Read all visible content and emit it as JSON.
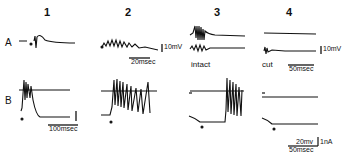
{
  "figure": {
    "columns": [
      "1",
      "2",
      "3",
      "4"
    ],
    "rows": [
      "A",
      "B"
    ],
    "row_a": {
      "scale_2": {
        "voltage": "10mV",
        "time": "20msec"
      },
      "scale_4": {
        "voltage": "10mV",
        "time": "50msec"
      },
      "label_3": "intact",
      "label_4": "cut"
    },
    "row_b": {
      "scale_1": {
        "time": "100msec"
      },
      "scale_4": {
        "voltage": "20mv",
        "current": "1nA",
        "time": "50msec"
      }
    }
  }
}
